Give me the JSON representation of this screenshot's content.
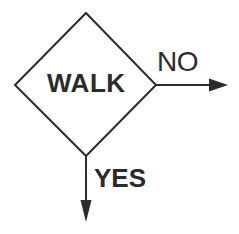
{
  "diagram": {
    "type": "flowchart-decision",
    "background_color": "#ffffff",
    "stroke_color": "#2b2b2b",
    "text_color": "#2b2b2b",
    "stroke_width": 2,
    "decision_node": {
      "label": "WALK",
      "shape": "diamond",
      "vertices": {
        "top": [
          86,
          13
        ],
        "right": [
          156,
          85
        ],
        "bottom": [
          86,
          156
        ],
        "left": [
          15,
          85
        ]
      }
    },
    "branches": [
      {
        "label": "NO",
        "direction": "right",
        "from": [
          156,
          85
        ],
        "to": [
          228,
          85
        ],
        "arrowhead": "solid-triangle"
      },
      {
        "label": "YES",
        "direction": "down",
        "from": [
          86,
          156
        ],
        "to": [
          86,
          222
        ],
        "arrowhead": "solid-triangle"
      }
    ]
  }
}
